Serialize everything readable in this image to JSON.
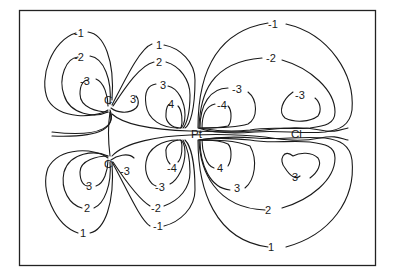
{
  "diagram": {
    "type": "contour-map",
    "atoms": {
      "c_top": "C",
      "c_bottom": "C",
      "pt": "Pt",
      "cl": "Cl"
    },
    "contour_labels": {
      "ul_m1": "-1",
      "ul_m2": "-2",
      "ul_m3": "-3",
      "ul_c3": "3",
      "um_1": "1",
      "um_2": "2",
      "um_3": "3",
      "um_4": "4",
      "ur_m1": "-1",
      "ur_m2": "-2",
      "ur_m3": "-3",
      "ur_m4": "-4",
      "ur_cl_m3": "-3",
      "ll_3": "3",
      "ll_2": "2",
      "ll_1": "1",
      "ll_cm3": "-3",
      "lm_m4": "-4",
      "lm_m3": "-3",
      "lm_m2": "-2",
      "lm_m1": "-1",
      "lr_4": "4",
      "lr_3": "3",
      "lr_cl_3": "3",
      "lr_2": "2",
      "lr_1": "1"
    }
  }
}
